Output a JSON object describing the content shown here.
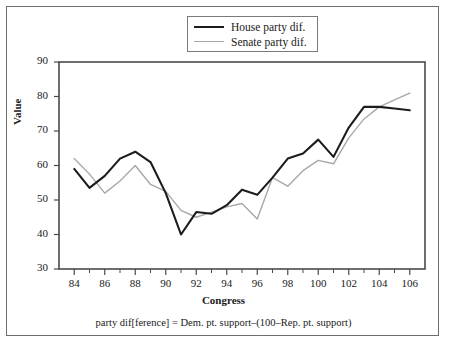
{
  "chart_data": {
    "type": "line",
    "title": "",
    "xlabel": "Congress",
    "ylabel": "Value",
    "xlim": [
      83,
      107
    ],
    "ylim": [
      30,
      90
    ],
    "yticks": [
      30,
      40,
      50,
      60,
      70,
      80,
      90
    ],
    "xticks": [
      84,
      86,
      88,
      90,
      92,
      94,
      96,
      98,
      100,
      102,
      104,
      106
    ],
    "x_minor_ticks": [
      85,
      87,
      89,
      91,
      93,
      95,
      97,
      99,
      101,
      103,
      105
    ],
    "grid": false,
    "legend_position": "top-center",
    "x": [
      84,
      85,
      86,
      87,
      88,
      89,
      90,
      91,
      92,
      93,
      94,
      95,
      96,
      97,
      98,
      99,
      100,
      101,
      102,
      103,
      104,
      105,
      106
    ],
    "series": [
      {
        "name": "House party dif.",
        "color": "#1c1c1c",
        "values": [
          59,
          53.5,
          57,
          62,
          64,
          61,
          52,
          40,
          46.5,
          46,
          48.5,
          53,
          51.5,
          56.5,
          62,
          63.5,
          67.5,
          62.5,
          71,
          77,
          77,
          76.5,
          76
        ]
      },
      {
        "name": "Senate party dif.",
        "color": "#a8a8a8",
        "values": [
          62,
          57.5,
          52,
          55.5,
          60,
          54.5,
          52.5,
          47,
          45,
          46.5,
          48,
          49,
          44.5,
          56.5,
          54,
          58.5,
          61.5,
          60.5,
          68,
          73.5,
          77,
          79,
          81
        ]
      }
    ],
    "caption": "party dif[ference] = Dem. pt. support–(100–Rep. pt. support)"
  },
  "legend": {
    "items": [
      {
        "label": "House party dif."
      },
      {
        "label": "Senate party dif."
      }
    ]
  }
}
